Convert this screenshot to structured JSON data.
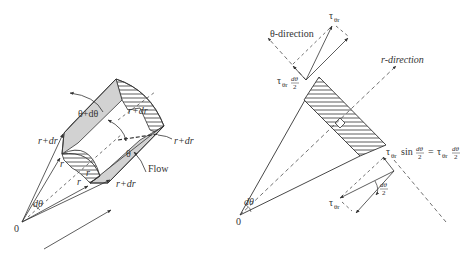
{
  "figure": {
    "left": {
      "title": "Fluid element in polar coordinates",
      "labels": {
        "origin": "0",
        "dtheta": "dθ",
        "r_left": "r",
        "r_bottom": "r",
        "r_inner": "r",
        "r_plus_dr_left": "r+dr",
        "r_plus_dr_top": "r+dr",
        "r_plus_dr_right": "r+dr",
        "r_plus_dr_bottom": "r+dr",
        "theta_plus_dtheta": "θ+dθ",
        "theta": "θ",
        "flow": "Flow"
      }
    },
    "right": {
      "title": "Shear stress force components",
      "labels": {
        "origin": "0",
        "dtheta": "dθ",
        "theta_direction": "θ-direction",
        "r_direction": "r-direction",
        "tau_top": "τ",
        "tau_top_sub": "θr",
        "tau_left": "τ",
        "tau_left_sub": "θr",
        "tau_left_frac_num": "dθ",
        "tau_left_frac_den": "2",
        "eq_tau": "τ",
        "eq_sub": "θr",
        "eq_sin": "sin",
        "eq_frac_num": "dθ",
        "eq_frac_den": "2",
        "eq_equals": "=",
        "eq_tau2": "τ",
        "eq_sub2": "θr",
        "eq_frac2_num": "dθ",
        "eq_frac2_den": "2",
        "angle_num": "dθ",
        "angle_den": "2",
        "tau_bottom": "τ",
        "tau_bottom_sub": "θr"
      }
    },
    "colors": {
      "line": "#333333",
      "shade": "#d2d2d2",
      "background": "#ffffff"
    }
  }
}
